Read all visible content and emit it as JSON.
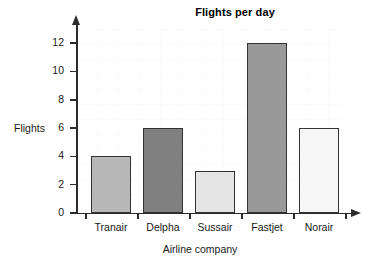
{
  "chart_data": {
    "type": "bar",
    "title": "Flights per day",
    "xlabel": "Airline company",
    "ylabel": "Flights",
    "categories": [
      "Tranair",
      "Delpha",
      "Sussair",
      "Fastjet",
      "Norair"
    ],
    "values": [
      4,
      6,
      3,
      12,
      6
    ],
    "ylim": [
      0,
      13
    ],
    "yticks": [
      0,
      2,
      4,
      6,
      8,
      10,
      12
    ],
    "ytick_labels": [
      "0",
      "2",
      "4",
      "6",
      "8",
      "10",
      "12"
    ],
    "grid": true,
    "legend": "none",
    "bar_colors": [
      "#b8b8b8",
      "#808080",
      "#e5e5e5",
      "#999999",
      "#f7f7f7"
    ],
    "bar_edge_color": "#333333",
    "axis_color": "#2b2b2b",
    "bars": [
      {
        "label": "Tranair",
        "value": 4,
        "color": "#b8b8b8"
      },
      {
        "label": "Delpha",
        "value": 6,
        "color": "#808080"
      },
      {
        "label": "Sussair",
        "value": 3,
        "color": "#e5e5e5"
      },
      {
        "label": "Fastjet",
        "value": 12,
        "color": "#999999"
      },
      {
        "label": "Norair",
        "value": 6,
        "color": "#f7f7f7"
      }
    ]
  }
}
